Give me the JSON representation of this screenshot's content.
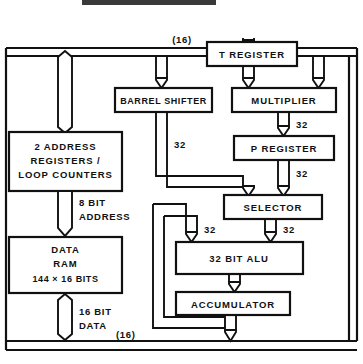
{
  "diagram": {
    "bus_top_label": "(16)",
    "bus_bottom_label": "(16)",
    "blocks": [
      {
        "id": "t_register",
        "label": "T  REGISTER"
      },
      {
        "id": "barrel_shifter",
        "label": "BARREL  SHIFTER"
      },
      {
        "id": "multiplier",
        "label": "MULTIPLIER"
      },
      {
        "id": "p_register",
        "label": "P  REGISTER"
      },
      {
        "id": "selector",
        "label": "SELECTOR"
      },
      {
        "id": "alu",
        "label": "32  BIT  ALU"
      },
      {
        "id": "accumulator",
        "label": "ACCUMULATOR"
      }
    ],
    "address_block": {
      "line1": "2  ADDRESS",
      "line2": "REGISTERS /",
      "line3": "LOOP  COUNTERS"
    },
    "ram_block": {
      "line1": "DATA",
      "line2": "RAM",
      "line3": "144 × 16  BITS"
    },
    "annotations": {
      "addr_bus_line1": "8  BIT",
      "addr_bus_line2": "ADDRESS",
      "data_bus_line1": "16  BIT",
      "data_bus_line2": "DATA",
      "shifter_width": "32",
      "mult_out_width": "32",
      "preg_out_width": "32",
      "alu_in_left_width": "32",
      "alu_in_right_width": "32"
    }
  }
}
